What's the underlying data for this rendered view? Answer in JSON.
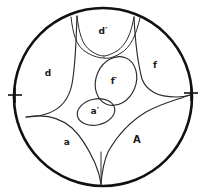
{
  "figure": {
    "background_color": "#ffffff",
    "boundary_color": "#111111",
    "curve_color": "#2a2a2a",
    "label_color": "#1a1a1a",
    "disk": {
      "center_x": 103,
      "center_y": 97,
      "radius": 89,
      "stroke_width": 2.6
    },
    "tick_marks": [
      {
        "name": "left-tick",
        "x1": 8,
        "y1": 95,
        "x2": 22,
        "y2": 95
      },
      {
        "name": "left-tick-cross",
        "x1": 15,
        "y1": 88,
        "x2": 15,
        "y2": 103
      },
      {
        "name": "right-tick",
        "x1": 184,
        "y1": 93,
        "x2": 198,
        "y2": 93
      },
      {
        "name": "right-tick-cross",
        "x1": 191,
        "y1": 86,
        "x2": 191,
        "y2": 101
      }
    ],
    "labels": [
      {
        "id": "d-prime",
        "text": "d′",
        "x": 103,
        "y": 31,
        "size": "normal"
      },
      {
        "id": "d",
        "text": "d",
        "x": 48,
        "y": 73,
        "size": "normal"
      },
      {
        "id": "f",
        "text": "f",
        "x": 155,
        "y": 65,
        "size": "normal"
      },
      {
        "id": "f-prime",
        "text": "f′",
        "x": 114,
        "y": 81,
        "size": "normal"
      },
      {
        "id": "a-prime",
        "text": "a′",
        "x": 95,
        "y": 111,
        "size": "normal"
      },
      {
        "id": "a",
        "text": "a",
        "x": 67,
        "y": 142,
        "size": "normal"
      },
      {
        "id": "A",
        "text": "A",
        "x": 137,
        "y": 140,
        "size": "cap"
      }
    ],
    "curves": [
      {
        "id": "upper-left-channel-outer",
        "kind": "channel",
        "d": "M 71 17 C 73 34, 76 46, 86 52 C 94 57, 100 58, 104 58"
      },
      {
        "id": "upper-left-channel-inner",
        "kind": "channel",
        "d": "M 77 16 C 79 33, 82 45, 91 51 C 97 55, 101 56, 104 56"
      },
      {
        "id": "upper-right-channel-outer",
        "kind": "channel",
        "d": "M 140 18 C 136 35, 131 47, 121 53 C 113 58, 107 59, 104 58"
      },
      {
        "id": "upper-right-channel-inner",
        "kind": "channel",
        "d": "M 134 17 C 131 34, 126 45, 117 51 C 110 55, 106 56, 104 56"
      },
      {
        "id": "left-partition-upper",
        "kind": "partition",
        "d": "M 77 16 C 76 38, 76 62, 72 84 C 69 99, 62 108, 49 113 C 41 116, 33 117, 26 117"
      },
      {
        "id": "right-partition-upper",
        "kind": "partition",
        "d": "M 134 17 C 135 38, 137 60, 142 79 C 147 92, 160 97, 176 97 C 182 97, 187 96, 190 95"
      },
      {
        "id": "left-partition-lower",
        "kind": "partition",
        "d": "M 26 117 C 44 114, 60 117, 72 128 C 82 137, 89 150, 95 163 C 98 170, 100 177, 101 184"
      },
      {
        "id": "right-partition-lower",
        "kind": "partition",
        "d": "M 190 95 C 176 100, 160 104, 146 112 C 131 121, 117 136, 108 152 C 104 161, 102 172, 101 184"
      },
      {
        "id": "bottom-channel-stem",
        "kind": "channel",
        "d": "M 101 152 C 101 162, 101 173, 101 185"
      }
    ],
    "ovals": [
      {
        "id": "f-prime-oval",
        "cx": 116,
        "cy": 81,
        "rx": 20,
        "ry": 25,
        "rotation": 22
      },
      {
        "id": "a-prime-oval",
        "cx": 96,
        "cy": 112,
        "rx": 19,
        "ry": 13,
        "rotation": -12
      }
    ]
  }
}
